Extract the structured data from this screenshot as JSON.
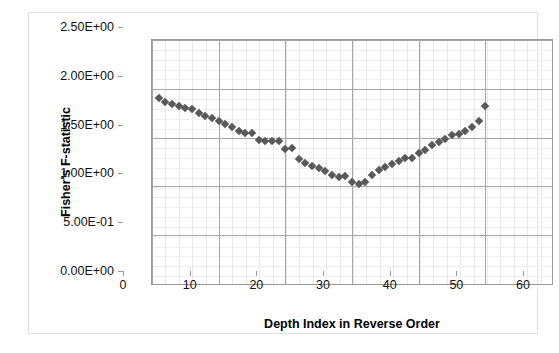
{
  "chart_data": {
    "type": "scatter",
    "title": "",
    "xlabel": "Depth Index in Reverse Order",
    "ylabel": "Fisher's F-statistic",
    "xlim": [
      0,
      60
    ],
    "ylim": [
      0,
      2.5
    ],
    "x_major_step": 10,
    "x_minor_step": 2,
    "y_major_step": 0.5,
    "y_minor_step": 0.1,
    "grid": true,
    "legend": false,
    "legend_position": "none",
    "marker": "diamond",
    "marker_color": "#595959",
    "xticklabels": [
      "0",
      "10",
      "20",
      "30",
      "40",
      "50",
      "60"
    ],
    "xtickvalues": [
      0,
      10,
      20,
      30,
      40,
      50,
      60
    ],
    "yticklabels": [
      "0.00E+00",
      "5.00E-01",
      "1.00E+00",
      "1.50E+00",
      "2.00E+00",
      "2.50E+00"
    ],
    "ytickvalues": [
      0,
      0.5,
      1.0,
      1.5,
      2.0,
      2.5
    ],
    "series": [
      {
        "name": "Fisher's F-statistic",
        "x": [
          1,
          2,
          3,
          4,
          5,
          6,
          7,
          8,
          9,
          10,
          11,
          12,
          13,
          14,
          15,
          16,
          17,
          18,
          19,
          20,
          21,
          22,
          23,
          24,
          25,
          26,
          27,
          28,
          29,
          30,
          31,
          32,
          33,
          34,
          35,
          36,
          37,
          38,
          39,
          40,
          41,
          42,
          43,
          44,
          45,
          46,
          47,
          48,
          49,
          50
        ],
        "y": [
          1.91,
          1.86,
          1.84,
          1.82,
          1.8,
          1.79,
          1.75,
          1.72,
          1.7,
          1.67,
          1.64,
          1.61,
          1.57,
          1.55,
          1.55,
          1.48,
          1.47,
          1.47,
          1.47,
          1.38,
          1.39,
          1.28,
          1.24,
          1.21,
          1.19,
          1.16,
          1.12,
          1.1,
          1.11,
          1.04,
          1.02,
          1.04,
          1.12,
          1.17,
          1.2,
          1.23,
          1.26,
          1.29,
          1.29,
          1.34,
          1.37,
          1.42,
          1.46,
          1.49,
          1.53,
          1.54,
          1.57,
          1.61,
          1.67,
          1.82
        ]
      }
    ]
  },
  "axis": {
    "y_title": "Fisher's F-statistic",
    "x_title": "Depth Index in Reverse Order"
  }
}
